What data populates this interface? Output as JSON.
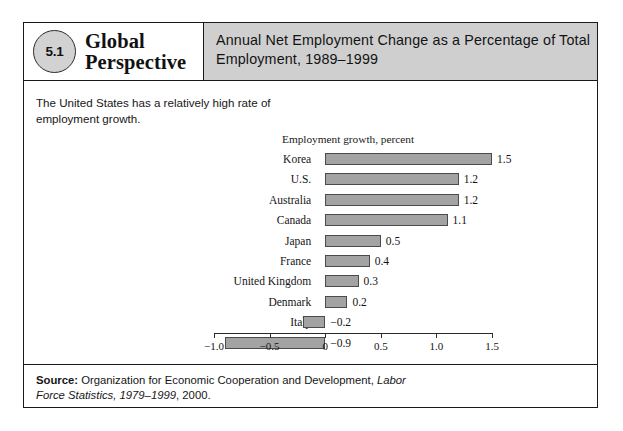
{
  "header": {
    "badge_number": "5.1",
    "feature_line1": "Global",
    "feature_line2": "Perspective",
    "title": "Annual Net Employment Change as a Percentage of Total Employment, 1989–1999"
  },
  "intro_text": "The United States has a relatively high rate of employment growth.",
  "source": {
    "label": "Source:",
    "text_part1": " Organization for Economic Cooperation and Development, ",
    "italic_part": "Labor Force Statistics, 1979–1999",
    "text_part2": ", 2000."
  },
  "chart_data": {
    "type": "bar",
    "orientation": "horizontal",
    "title": "",
    "caption": "Employment growth, percent",
    "xlabel": "",
    "ylabel": "",
    "categories": [
      "Korea",
      "U.S.",
      "Australia",
      "Canada",
      "Japan",
      "France",
      "United Kingdom",
      "Denmark",
      "Italy",
      "Sweden"
    ],
    "values": [
      1.5,
      1.2,
      1.2,
      1.1,
      0.5,
      0.4,
      0.3,
      0.2,
      -0.2,
      -0.9
    ],
    "value_labels": [
      "1.5",
      "1.2",
      "1.2",
      "1.1",
      "0.5",
      "0.4",
      "0.3",
      "0.2",
      "−0.2",
      "−0.9"
    ],
    "xlim": [
      -1.0,
      1.5
    ],
    "xticks": [
      -1.0,
      -0.5,
      0,
      0.5,
      1.0,
      1.5
    ],
    "xtick_labels": [
      "−1.0",
      "−0.5",
      "0",
      "0.5",
      "1.0",
      "1.5"
    ],
    "grid": false,
    "legend": null,
    "bar_color": "#a3a3a3",
    "bar_border_color": "#4b4b4b"
  },
  "colors": {
    "frame": "#1a1a1a",
    "header_band": "#cfcfcf",
    "badge_fill": "#d2d2d2",
    "text": "#141414"
  }
}
